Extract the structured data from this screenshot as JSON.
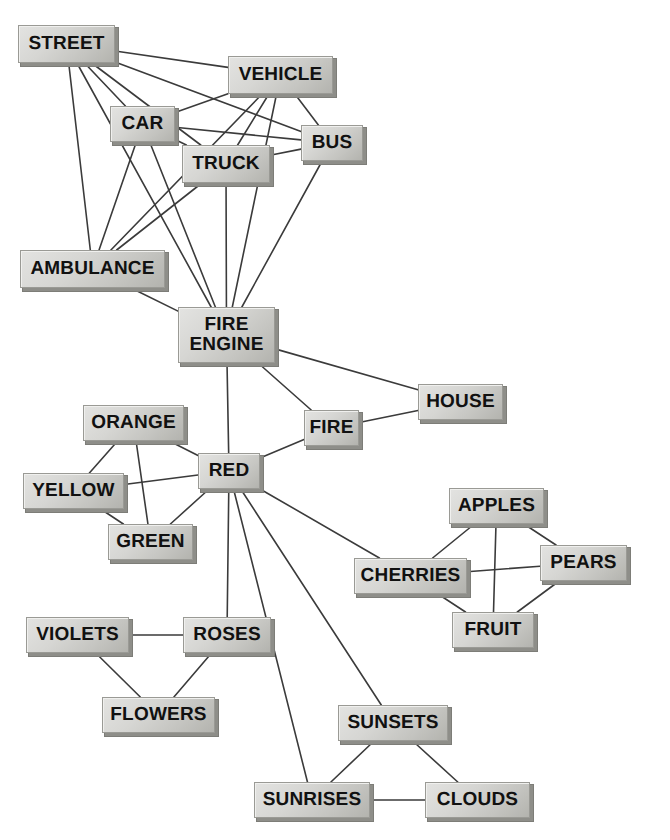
{
  "diagram": {
    "type": "semantic-network",
    "background_color": "#ffffff",
    "node_fill_color": "#d6d6d3",
    "node_border_color": "#9a9a95",
    "node_shadow_color": "#8e8e89",
    "edge_color": "#3b3b3b",
    "canvas": {
      "width": 670,
      "height": 840
    }
  },
  "nodes": [
    {
      "id": "street",
      "label": "STREET",
      "x": 18,
      "y": 25,
      "w": 97,
      "h": 38,
      "font_size": 19
    },
    {
      "id": "vehicle",
      "label": "VEHICLE",
      "x": 228,
      "y": 56,
      "w": 105,
      "h": 38,
      "font_size": 19
    },
    {
      "id": "car",
      "label": "CAR",
      "x": 110,
      "y": 106,
      "w": 65,
      "h": 36,
      "font_size": 19
    },
    {
      "id": "bus",
      "label": "BUS",
      "x": 301,
      "y": 125,
      "w": 62,
      "h": 36,
      "font_size": 19
    },
    {
      "id": "truck",
      "label": "TRUCK",
      "x": 182,
      "y": 145,
      "w": 88,
      "h": 38,
      "font_size": 19
    },
    {
      "id": "ambulance",
      "label": "AMBULANCE",
      "x": 20,
      "y": 250,
      "w": 145,
      "h": 38,
      "font_size": 19
    },
    {
      "id": "fire_engine",
      "label": "FIRE\nENGINE",
      "x": 178,
      "y": 307,
      "w": 97,
      "h": 56,
      "font_size": 19
    },
    {
      "id": "house",
      "label": "HOUSE",
      "x": 418,
      "y": 384,
      "w": 85,
      "h": 36,
      "font_size": 19
    },
    {
      "id": "orange",
      "label": "ORANGE",
      "x": 83,
      "y": 405,
      "w": 101,
      "h": 36,
      "font_size": 19
    },
    {
      "id": "fire",
      "label": "FIRE",
      "x": 304,
      "y": 410,
      "w": 55,
      "h": 36,
      "font_size": 19
    },
    {
      "id": "red",
      "label": "RED",
      "x": 198,
      "y": 453,
      "w": 62,
      "h": 36,
      "font_size": 19
    },
    {
      "id": "yellow",
      "label": "YELLOW",
      "x": 23,
      "y": 473,
      "w": 101,
      "h": 36,
      "font_size": 19
    },
    {
      "id": "apples",
      "label": "APPLES",
      "x": 449,
      "y": 488,
      "w": 95,
      "h": 36,
      "font_size": 19
    },
    {
      "id": "green",
      "label": "GREEN",
      "x": 108,
      "y": 524,
      "w": 85,
      "h": 36,
      "font_size": 19
    },
    {
      "id": "pears",
      "label": "PEARS",
      "x": 540,
      "y": 545,
      "w": 87,
      "h": 36,
      "font_size": 19
    },
    {
      "id": "cherries",
      "label": "CHERRIES",
      "x": 354,
      "y": 558,
      "w": 113,
      "h": 36,
      "font_size": 19
    },
    {
      "id": "fruit",
      "label": "FRUIT",
      "x": 452,
      "y": 612,
      "w": 82,
      "h": 36,
      "font_size": 19
    },
    {
      "id": "violets",
      "label": "VIOLETS",
      "x": 26,
      "y": 617,
      "w": 103,
      "h": 36,
      "font_size": 19
    },
    {
      "id": "roses",
      "label": "ROSES",
      "x": 183,
      "y": 617,
      "w": 88,
      "h": 36,
      "font_size": 19
    },
    {
      "id": "flowers",
      "label": "FLOWERS",
      "x": 102,
      "y": 697,
      "w": 113,
      "h": 36,
      "font_size": 19
    },
    {
      "id": "sunsets",
      "label": "SUNSETS",
      "x": 338,
      "y": 705,
      "w": 110,
      "h": 36,
      "font_size": 19
    },
    {
      "id": "sunrises",
      "label": "SUNRISES",
      "x": 254,
      "y": 782,
      "w": 116,
      "h": 36,
      "font_size": 19
    },
    {
      "id": "clouds",
      "label": "CLOUDS",
      "x": 425,
      "y": 782,
      "w": 105,
      "h": 36,
      "font_size": 19
    }
  ],
  "edges": [
    {
      "from": "street",
      "to": "vehicle"
    },
    {
      "from": "street",
      "to": "car"
    },
    {
      "from": "street",
      "to": "bus"
    },
    {
      "from": "street",
      "to": "truck"
    },
    {
      "from": "street",
      "to": "ambulance"
    },
    {
      "from": "street",
      "to": "fire_engine"
    },
    {
      "from": "vehicle",
      "to": "car"
    },
    {
      "from": "vehicle",
      "to": "bus"
    },
    {
      "from": "vehicle",
      "to": "truck"
    },
    {
      "from": "vehicle",
      "to": "ambulance"
    },
    {
      "from": "vehicle",
      "to": "fire_engine"
    },
    {
      "from": "car",
      "to": "bus"
    },
    {
      "from": "car",
      "to": "truck"
    },
    {
      "from": "car",
      "to": "ambulance"
    },
    {
      "from": "car",
      "to": "fire_engine"
    },
    {
      "from": "bus",
      "to": "truck"
    },
    {
      "from": "bus",
      "to": "fire_engine"
    },
    {
      "from": "truck",
      "to": "ambulance"
    },
    {
      "from": "truck",
      "to": "fire_engine"
    },
    {
      "from": "ambulance",
      "to": "fire_engine"
    },
    {
      "from": "fire_engine",
      "to": "house"
    },
    {
      "from": "fire_engine",
      "to": "fire"
    },
    {
      "from": "fire_engine",
      "to": "red"
    },
    {
      "from": "fire",
      "to": "house"
    },
    {
      "from": "fire",
      "to": "red"
    },
    {
      "from": "red",
      "to": "orange"
    },
    {
      "from": "red",
      "to": "yellow"
    },
    {
      "from": "red",
      "to": "green"
    },
    {
      "from": "red",
      "to": "cherries"
    },
    {
      "from": "red",
      "to": "roses"
    },
    {
      "from": "red",
      "to": "sunsets"
    },
    {
      "from": "red",
      "to": "sunrises"
    },
    {
      "from": "orange",
      "to": "yellow"
    },
    {
      "from": "orange",
      "to": "green"
    },
    {
      "from": "yellow",
      "to": "green"
    },
    {
      "from": "apples",
      "to": "cherries"
    },
    {
      "from": "apples",
      "to": "pears"
    },
    {
      "from": "apples",
      "to": "fruit"
    },
    {
      "from": "cherries",
      "to": "pears"
    },
    {
      "from": "cherries",
      "to": "fruit"
    },
    {
      "from": "pears",
      "to": "fruit"
    },
    {
      "from": "violets",
      "to": "roses"
    },
    {
      "from": "violets",
      "to": "flowers"
    },
    {
      "from": "roses",
      "to": "flowers"
    },
    {
      "from": "sunsets",
      "to": "sunrises"
    },
    {
      "from": "sunsets",
      "to": "clouds"
    },
    {
      "from": "sunrises",
      "to": "clouds"
    }
  ]
}
